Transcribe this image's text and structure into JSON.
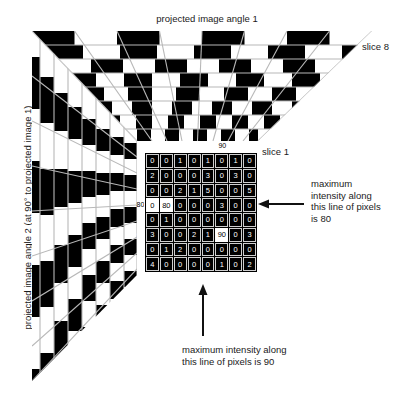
{
  "figure": {
    "title_top": "projected image angle 1",
    "axis_left": "projected image angle 2 (at 90° to projected image 1)",
    "slice_far_label": "slice 8",
    "slice_near_label": "slice 1",
    "annotation_right": "maximum\nintensity along\nthis line of pixels\nis 80",
    "annotation_bottom": "maximum intensity along\nthis line of pixels is 90"
  },
  "colors": {
    "background": "#ffffff",
    "cell_dark": "#000000",
    "cell_light": "#ffffff",
    "text_dark": "#1a1a1a",
    "grid_line": "#cfcfcf"
  },
  "chart_data": {
    "type": "heatmap",
    "title": "projected image angle 1",
    "xlabel": "projected image angle 1",
    "ylabel": "projected image angle 2 (at 90° to projected image 1)",
    "column_projection_label": "projected image angle 1",
    "row_projection_label": "projected image angle 2 (at 90° to projected image 1)",
    "column_headers": [
      4,
      80,
      2,
      2,
      6,
      90,
      3,
      5
    ],
    "row_headers": [
      1,
      3,
      5,
      80,
      1,
      90,
      2,
      4
    ],
    "matrix": [
      [
        0,
        0,
        1,
        0,
        1,
        0,
        1,
        0
      ],
      [
        2,
        0,
        0,
        0,
        3,
        0,
        3,
        0
      ],
      [
        0,
        0,
        2,
        1,
        5,
        0,
        0,
        5
      ],
      [
        0,
        80,
        0,
        0,
        0,
        3,
        0,
        0
      ],
      [
        0,
        1,
        0,
        0,
        0,
        0,
        0,
        0
      ],
      [
        3,
        0,
        0,
        2,
        1,
        90,
        0,
        3
      ],
      [
        0,
        1,
        2,
        0,
        0,
        0,
        0,
        0
      ],
      [
        4,
        0,
        0,
        0,
        0,
        1,
        0,
        2
      ]
    ],
    "highlighted_row_index": 3,
    "highlighted_row_max": 80,
    "highlighted_column_index": 5,
    "highlighted_column_max": 90,
    "slices": 8,
    "grid": true,
    "legend": "none"
  }
}
